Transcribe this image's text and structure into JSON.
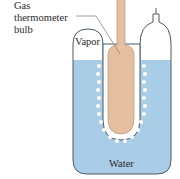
{
  "labels": {
    "gas_line1": "Gas",
    "gas_line2": "thermometer",
    "gas_line3": "bulb",
    "vapor": "Vapor",
    "water": "Water"
  },
  "colors": {
    "water": "#a9cde6",
    "outline": "#4a5a66",
    "bulb": "#e6bfa0",
    "ice": "#ffffff",
    "leader": "#888888"
  }
}
